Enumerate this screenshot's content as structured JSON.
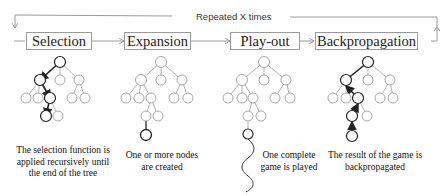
{
  "loop": {
    "label": "Repeated X times"
  },
  "stages": [
    {
      "label": "Selection",
      "caption": [
        "The selection function is",
        "applied recursively until",
        "the end of the tree"
      ]
    },
    {
      "label": "Expansion",
      "caption": [
        "One or more nodes",
        "are created"
      ]
    },
    {
      "label": "Play-out",
      "caption": [
        "One complete",
        "game is played"
      ]
    },
    {
      "label": "Backpropagation",
      "caption": [
        "The result of the game is",
        "backpropagated"
      ]
    }
  ],
  "colors": {
    "line": "#9a9a9a",
    "node_light": "#a8a8a8",
    "highlight": "#222222",
    "text": "#222222"
  }
}
